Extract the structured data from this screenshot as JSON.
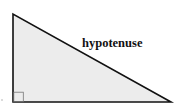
{
  "diagram": {
    "type": "right-triangle",
    "label": "hypotenuse",
    "vertices": {
      "top": [
        13,
        14
      ],
      "right_angle": [
        13,
        102
      ],
      "right": [
        171,
        102
      ]
    },
    "right_angle_marker_size": 10,
    "colors": {
      "fill": "#ececec",
      "stroke": "#111111",
      "background": "#ffffff",
      "label": "#111111"
    }
  }
}
